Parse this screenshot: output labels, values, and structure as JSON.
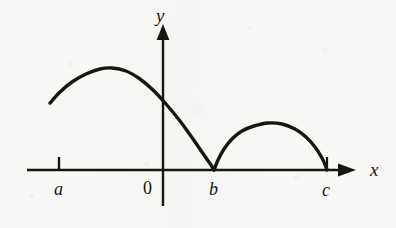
{
  "figure": {
    "kind": "cartesian-plot",
    "width": 396,
    "height": 228,
    "background_color": "#f8f8f6",
    "ink_color": "#18160f"
  },
  "axes": {
    "x_axis": {
      "label": "x",
      "label_x": 370,
      "label_y": 162,
      "line_y": 170,
      "start_x": 27,
      "end_x": 356,
      "arrow": "right"
    },
    "y_axis": {
      "label": "y",
      "label_x": 156,
      "label_y": 6,
      "line_x": 163,
      "top_y": 26,
      "bottom_y": 206,
      "arrow": "up"
    }
  },
  "ticks": [
    {
      "name": "tick-a",
      "x": 59,
      "y_top": 157,
      "y_bottom": 170
    },
    {
      "name": "tick-c",
      "x": 327,
      "y_top": 157,
      "y_bottom": 170
    }
  ],
  "labels": [
    {
      "name": "label-a",
      "text": "a",
      "x": 54,
      "y": 180,
      "style": "italic"
    },
    {
      "name": "label-origin",
      "text": "0",
      "x": 143,
      "y": 179,
      "style": "upright"
    },
    {
      "name": "label-b",
      "text": "b",
      "x": 209,
      "y": 180,
      "style": "italic"
    },
    {
      "name": "label-c",
      "text": "c",
      "x": 322,
      "y": 181,
      "style": "italic"
    }
  ],
  "chart_data": {
    "type": "line",
    "title": "",
    "xlabel": "x",
    "ylabel": "y",
    "grid": false,
    "legend": null,
    "axis_origin_px": {
      "x": 163,
      "y": 170
    },
    "named_x_values": [
      "a",
      "0",
      "b",
      "c"
    ],
    "named_x_pixels": [
      59,
      163,
      214,
      327
    ],
    "series": [
      {
        "name": "arch-1",
        "from": "a",
        "to": "b",
        "path_points_px": [
          [
            50,
            103
          ],
          [
            60,
            92
          ],
          [
            72,
            82
          ],
          [
            86,
            74
          ],
          [
            100,
            69
          ],
          [
            112,
            68
          ],
          [
            126,
            71
          ],
          [
            140,
            79
          ],
          [
            153,
            90
          ],
          [
            166,
            104
          ],
          [
            180,
            121
          ],
          [
            193,
            139
          ],
          [
            204,
            155
          ],
          [
            211,
            165
          ],
          [
            214,
            170
          ]
        ],
        "peak_px": [
          112,
          68
        ],
        "endpoint_style_start": "open",
        "endpoint_style_end": "cusp"
      },
      {
        "name": "arch-2",
        "from": "b",
        "to": "c",
        "path_points_px": [
          [
            214,
            170
          ],
          [
            218,
            160
          ],
          [
            224,
            149
          ],
          [
            232,
            139
          ],
          [
            242,
            131
          ],
          [
            254,
            126
          ],
          [
            268,
            123
          ],
          [
            282,
            124
          ],
          [
            295,
            129
          ],
          [
            306,
            137
          ],
          [
            315,
            147
          ],
          [
            322,
            158
          ],
          [
            326,
            167
          ],
          [
            327,
            170
          ]
        ],
        "peak_px": [
          272,
          123
        ],
        "endpoint_style_start": "cusp",
        "endpoint_style_end": "tick"
      }
    ]
  }
}
